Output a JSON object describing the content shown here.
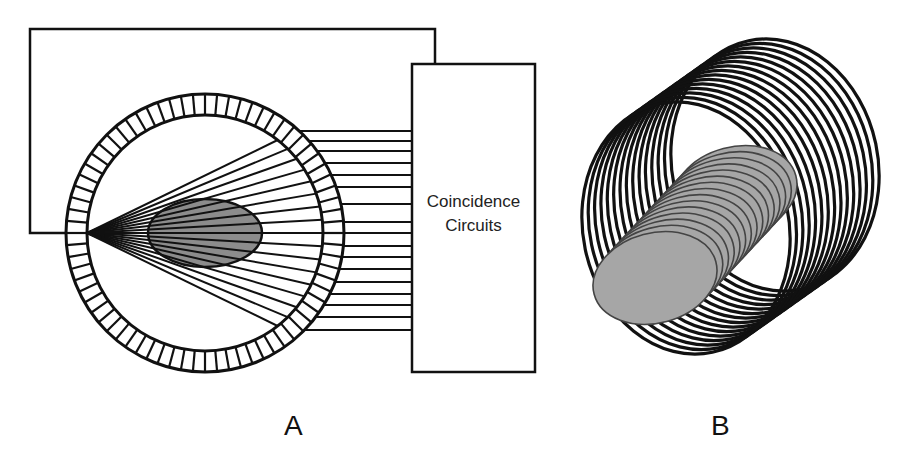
{
  "figure": {
    "panel_a": {
      "label": "A",
      "coincidence_box": {
        "line1": "Coincidence",
        "line2": "Circuits",
        "x": 412,
        "y": 64,
        "width": 123,
        "height": 308
      },
      "wire_loop": {
        "left": 30,
        "top": 29,
        "right": 435,
        "bottom": 233
      },
      "detector_ring": {
        "cx": 205,
        "cy": 233,
        "outer_r": 139,
        "inner_r": 118,
        "segments": 72
      },
      "object_ellipse": {
        "cx": 205,
        "cy": 233,
        "rx": 57,
        "ry": 34,
        "fill": "#8c8c8c"
      },
      "fan": {
        "apex_x": 87,
        "apex_y": 233,
        "line_count": 17,
        "angle_min_deg": -26,
        "angle_max_deg": 26
      },
      "output_lines": {
        "x_end": 412,
        "y_values": [
          131,
          141,
          151,
          163,
          175,
          187,
          204,
          222,
          233,
          246,
          257,
          269,
          282,
          294,
          305,
          317,
          330
        ]
      }
    },
    "panel_b": {
      "label": "B",
      "rings": {
        "count": 15,
        "front_cx": 686,
        "front_cy": 228,
        "back_cx": 775,
        "back_cy": 165,
        "rx": 103,
        "ry": 127,
        "rotate_deg": -12
      },
      "slices": {
        "count": 15,
        "front_cx": 655,
        "front_cy": 278,
        "back_cx": 735,
        "back_cy": 192,
        "rx": 63,
        "ry": 45,
        "rotate_deg": -15,
        "fill": "#a6a6a6"
      }
    },
    "colors": {
      "stroke": "#111111",
      "background": "#ffffff"
    }
  }
}
